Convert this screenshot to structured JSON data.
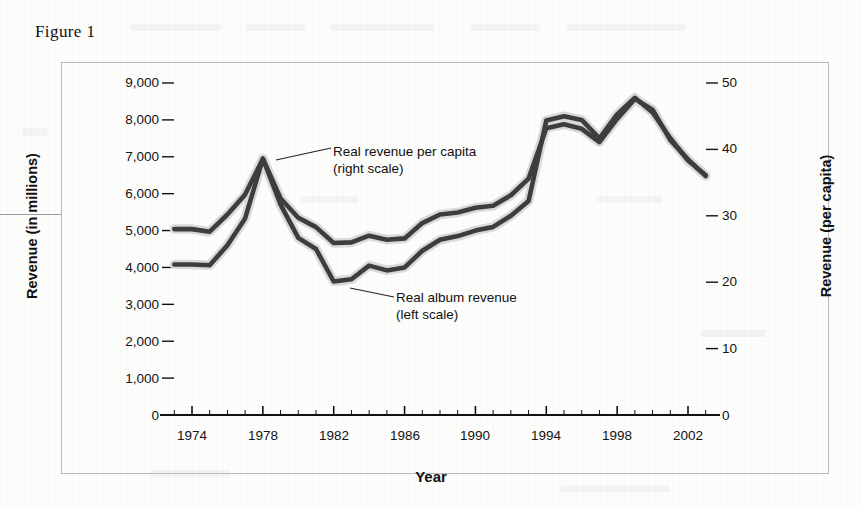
{
  "figure": {
    "caption": "Figure 1"
  },
  "chart_data": {
    "type": "line",
    "title": "Figure 1",
    "xlabel": "Year",
    "ylabel": "Revenue (in millions)",
    "ylabel_right": "Revenue (per capita)",
    "grid": false,
    "legend_position": "inline-annotations",
    "xlim": [
      1973,
      2003
    ],
    "ylim": [
      0,
      9000
    ],
    "ylim_right": [
      0,
      50
    ],
    "y_ticks": [
      "0",
      "1,000",
      "2,000",
      "3,000",
      "4,000",
      "5,000",
      "6,000",
      "7,000",
      "8,000",
      "9,000"
    ],
    "y_ticks_right": [
      "0",
      "10",
      "20",
      "30",
      "40",
      "50"
    ],
    "x_ticks": [
      "1974",
      "1978",
      "1982",
      "1986",
      "1990",
      "1994",
      "1998",
      "2002"
    ],
    "x_minor_tick_interval": 1,
    "x": [
      1973,
      1974,
      1975,
      1976,
      1977,
      1978,
      1979,
      1980,
      1981,
      1982,
      1983,
      1984,
      1985,
      1986,
      1987,
      1988,
      1989,
      1990,
      1991,
      1992,
      1993,
      1994,
      1995,
      1996,
      1997,
      1998,
      1999,
      2000,
      2001,
      2002,
      2003
    ],
    "series": [
      {
        "name": "Real revenue per capita (right scale)",
        "axis": "right",
        "color": "#3d3d3d",
        "values": [
          28.0,
          28.0,
          27.6,
          30.2,
          33.2,
          38.6,
          32.6,
          29.7,
          28.3,
          25.9,
          26.0,
          27.0,
          26.4,
          26.6,
          28.9,
          30.2,
          30.5,
          31.2,
          31.5,
          33.1,
          35.6,
          43.2,
          43.8,
          43.1,
          41.1,
          44.6,
          47.6,
          46.0,
          41.4,
          38.5,
          36.0
        ]
      },
      {
        "name": "Real album revenue (left scale)",
        "axis": "left",
        "color": "#3d3d3d",
        "values": [
          4080,
          4080,
          4060,
          4600,
          5330,
          6950,
          5700,
          4800,
          4500,
          3620,
          3680,
          4050,
          3920,
          4000,
          4450,
          4750,
          4850,
          5000,
          5100,
          5400,
          5800,
          7980,
          8100,
          8000,
          7500,
          8150,
          8600,
          8200,
          7500,
          6900,
          6500
        ]
      }
    ],
    "annotations": [
      {
        "name": "real-revenue-per-capita",
        "line1": "Real revenue per capita",
        "line2": "(right scale)",
        "target_x": 1978,
        "target_y_right": 38.6
      },
      {
        "name": "real-album-revenue",
        "line1": "Real album revenue",
        "line2": "(left scale)",
        "target_x": 1982,
        "target_y_left": 3620
      }
    ]
  },
  "axes": {
    "left_label": "Revenue (in millions)",
    "right_label": "Revenue (per capita)",
    "x_label": "Year",
    "left_ticks": [
      "9,000",
      "8,000",
      "7,000",
      "6,000",
      "5,000",
      "4,000",
      "3,000",
      "2,000",
      "1,000",
      "0"
    ],
    "right_ticks": [
      "50",
      "40",
      "30",
      "20",
      "10",
      "0"
    ],
    "x_ticks": [
      "1974",
      "1978",
      "1982",
      "1986",
      "1990",
      "1994",
      "1998",
      "2002"
    ]
  },
  "annotations": {
    "upper": {
      "line1": "Real revenue per capita",
      "line2": "(right scale)"
    },
    "lower": {
      "line1": "Real album revenue",
      "line2": "(left scale)"
    }
  },
  "colors": {
    "line": "#3d3d3d",
    "line_halo": "#d9d9d9",
    "frame": "#b9b9b9",
    "axis": "#111111",
    "text": "#131313",
    "page": "#fdfdfc"
  }
}
